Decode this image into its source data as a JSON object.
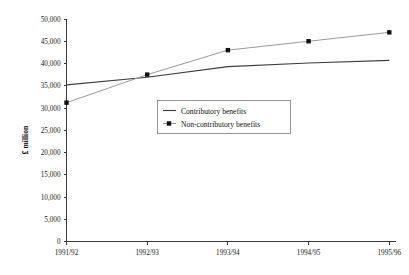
{
  "chart_data": {
    "type": "line",
    "title": "",
    "xlabel": "",
    "ylabel": "£ million",
    "categories": [
      "1991/92",
      "1992/93",
      "1993/94",
      "1994/95",
      "1995/96"
    ],
    "ylim": [
      0,
      50000
    ],
    "ytick_step": 5000,
    "ytick_labels": [
      "0",
      "5,000",
      "10,000",
      "15,000",
      "20,000",
      "25,000",
      "30,000",
      "35,000",
      "40,000",
      "45,000",
      "50,000"
    ],
    "ytick_values": [
      0,
      5000,
      10000,
      15000,
      20000,
      25000,
      30000,
      35000,
      40000,
      45000,
      50000
    ],
    "grid": false,
    "legend_position": "center",
    "series": [
      {
        "name": "Contributory benefits",
        "values": [
          35200,
          36900,
          39300,
          40100,
          40700
        ],
        "marker": "none",
        "color": "#3d3d3d"
      },
      {
        "name": "Non-contributory benefits",
        "values": [
          31200,
          37500,
          43000,
          45000,
          47000
        ],
        "marker": "square",
        "color": "#9a9a9a"
      }
    ]
  },
  "legend": {
    "items": [
      {
        "label": "Contributory benefits",
        "marker": "line"
      },
      {
        "label": "Non-contributory benefits",
        "marker": "line-square"
      }
    ]
  }
}
